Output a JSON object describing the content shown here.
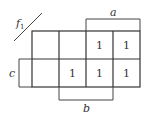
{
  "kmap": {
    "function_label": "f",
    "function_subscript": "1",
    "labels": {
      "a": "a",
      "b": "b",
      "c": "c"
    },
    "rows": [
      [
        "",
        "",
        "1",
        "1"
      ],
      [
        "",
        "1",
        "1",
        "1"
      ]
    ]
  },
  "colors": {
    "line": "#333333",
    "background": "#ffffff"
  }
}
